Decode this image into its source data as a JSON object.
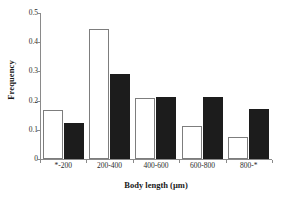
{
  "chart_data": {
    "type": "bar",
    "title": "",
    "xlabel": "Body length (µm)",
    "ylabel": "Frequency",
    "categories": [
      "*-200",
      "200-400",
      "400-600",
      "600-800",
      "800-*"
    ],
    "series": [
      {
        "name": "open",
        "style": "white-filled-with-black-outline",
        "color": "#ffffff",
        "values": [
          0.167,
          0.445,
          0.208,
          0.113,
          0.076
        ]
      },
      {
        "name": "filled",
        "style": "solid-black",
        "color": "#1c1c1c",
        "values": [
          0.125,
          0.292,
          0.212,
          0.212,
          0.17
        ]
      }
    ],
    "ylim": [
      0,
      0.5
    ],
    "ytick_values": [
      0,
      0.1,
      0.2,
      0.3,
      0.4,
      0.5
    ],
    "ytick_labels": [
      "0",
      "0.1",
      "0.2",
      "0.3",
      "0.4",
      "0.5"
    ],
    "grid": false,
    "legend": null,
    "legend_position": "none",
    "axis_color": "#8a8a8a"
  }
}
